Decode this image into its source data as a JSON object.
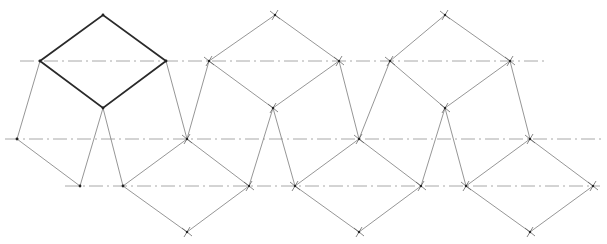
{
  "diagram": {
    "type": "geometric-construction",
    "colors": {
      "background": "#ffffff",
      "bold_edge": "#2a2a2a",
      "thin_edge": "#8a8a8a",
      "centerline": "#a8a8a8",
      "vertex_mark": "#555555"
    },
    "centerlines": [
      {
        "id": "upper",
        "x1": 20,
        "y1": 61,
        "x2": 545,
        "y2": 61
      },
      {
        "id": "middle",
        "x1": 5,
        "y1": 139,
        "x2": 605,
        "y2": 139
      },
      {
        "id": "lower",
        "x1": 65,
        "y1": 186,
        "x2": 600,
        "y2": 186
      }
    ],
    "rhombi": [
      {
        "id": "top-1",
        "bold": true,
        "points": [
          [
            40,
            61
          ],
          [
            103,
            15
          ],
          [
            166,
            61
          ],
          [
            103,
            108
          ]
        ]
      },
      {
        "id": "top-2",
        "bold": false,
        "points": [
          [
            209,
            61
          ],
          [
            275,
            15
          ],
          [
            339,
            61
          ],
          [
            273,
            108
          ]
        ]
      },
      {
        "id": "top-3",
        "bold": false,
        "points": [
          [
            390,
            61
          ],
          [
            445,
            15
          ],
          [
            510,
            61
          ],
          [
            445,
            108
          ]
        ]
      },
      {
        "id": "bottom-1",
        "bold": false,
        "points": [
          [
            123,
            186
          ],
          [
            187,
            139
          ],
          [
            249,
            186
          ],
          [
            187,
            232
          ]
        ]
      },
      {
        "id": "bottom-2",
        "bold": false,
        "points": [
          [
            295,
            186
          ],
          [
            359,
            139
          ],
          [
            421,
            186
          ],
          [
            359,
            232
          ]
        ]
      },
      {
        "id": "bottom-3",
        "bold": false,
        "points": [
          [
            466,
            186
          ],
          [
            530,
            139
          ],
          [
            593,
            186
          ],
          [
            530,
            232
          ]
        ]
      }
    ],
    "connectors": [
      {
        "id": "zig-left",
        "points": [
          [
            40,
            61
          ],
          [
            17,
            139
          ],
          [
            80,
            186
          ],
          [
            103,
            108
          ],
          [
            123,
            186
          ]
        ]
      },
      {
        "id": "zig-1",
        "points": [
          [
            166,
            61
          ],
          [
            187,
            139
          ],
          [
            209,
            61
          ]
        ]
      },
      {
        "id": "zig-2",
        "points": [
          [
            249,
            186
          ],
          [
            273,
            108
          ],
          [
            295,
            186
          ]
        ]
      },
      {
        "id": "zig-3",
        "points": [
          [
            339,
            61
          ],
          [
            359,
            139
          ],
          [
            390,
            61
          ]
        ]
      },
      {
        "id": "zig-4",
        "points": [
          [
            421,
            186
          ],
          [
            445,
            108
          ],
          [
            466,
            186
          ]
        ]
      },
      {
        "id": "zig-5",
        "points": [
          [
            510,
            61
          ],
          [
            530,
            139
          ]
        ]
      }
    ],
    "vertex_marks": [
      [
        275,
        15
      ],
      [
        445,
        15
      ],
      [
        209,
        61
      ],
      [
        339,
        61
      ],
      [
        390,
        61
      ],
      [
        510,
        61
      ],
      [
        273,
        108
      ],
      [
        445,
        108
      ],
      [
        187,
        139
      ],
      [
        359,
        139
      ],
      [
        530,
        139
      ],
      [
        249,
        186
      ],
      [
        295,
        186
      ],
      [
        421,
        186
      ],
      [
        466,
        186
      ],
      [
        593,
        186
      ],
      [
        187,
        232
      ],
      [
        359,
        232
      ],
      [
        530,
        232
      ]
    ],
    "dots": [
      [
        40,
        61
      ],
      [
        103,
        15
      ],
      [
        166,
        61
      ],
      [
        103,
        108
      ],
      [
        17,
        139
      ],
      [
        80,
        186
      ],
      [
        123,
        186
      ]
    ]
  }
}
